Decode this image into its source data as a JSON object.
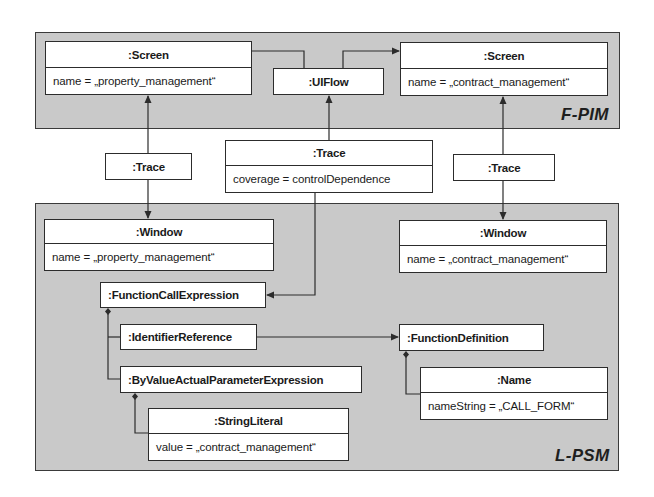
{
  "diagram": {
    "type": "UML object diagram",
    "colors": {
      "panel_fill": "#c9c9c9",
      "box_fill": "#ffffff",
      "line": "#2c2c2c"
    },
    "panels": {
      "fpim": {
        "label": "F-PIM"
      },
      "lpsm": {
        "label": "L-PSM"
      }
    },
    "objects": {
      "screen_left": {
        "name": ":Screen",
        "attribute": "name = „property_management“"
      },
      "uiflow": {
        "name": ":UIFlow"
      },
      "screen_right": {
        "name": ":Screen",
        "attribute": "name = „contract_management“"
      },
      "trace_left": {
        "name": ":Trace"
      },
      "trace_middle": {
        "name": ":Trace",
        "attribute": "coverage = controlDependence"
      },
      "trace_right": {
        "name": ":Trace"
      },
      "window_left": {
        "name": ":Window",
        "attribute": "name = „property_management“"
      },
      "window_right": {
        "name": ":Window",
        "attribute": "name = „contract_management“"
      },
      "function_call_expression": {
        "name": ":FunctionCallExpression"
      },
      "identifier_reference": {
        "name": ":IdentifierReference"
      },
      "by_value_param_expr": {
        "name": ":ByValueActualParameterExpression"
      },
      "string_literal": {
        "name": ":StringLiteral",
        "attribute": "value = „contract_management“"
      },
      "function_definition": {
        "name": ":FunctionDefinition"
      },
      "name_obj": {
        "name": ":Name",
        "attribute": "nameString = „CALL_FORM“"
      }
    },
    "links": [
      {
        "from": "screen_left",
        "to": "uiflow",
        "kind": "line"
      },
      {
        "from": "uiflow",
        "to": "screen_right",
        "kind": "arrow"
      },
      {
        "from": "trace_left",
        "to": "screen_left",
        "kind": "arrow"
      },
      {
        "from": "trace_left",
        "to": "window_left",
        "kind": "arrow"
      },
      {
        "from": "trace_middle",
        "to": "uiflow",
        "kind": "arrow"
      },
      {
        "from": "trace_middle",
        "to": "function_call_expression",
        "kind": "arrow"
      },
      {
        "from": "trace_right",
        "to": "screen_right",
        "kind": "arrow"
      },
      {
        "from": "trace_right",
        "to": "window_right",
        "kind": "arrow"
      },
      {
        "from": "function_call_expression",
        "to": "identifier_reference",
        "kind": "composition"
      },
      {
        "from": "function_call_expression",
        "to": "by_value_param_expr",
        "kind": "composition"
      },
      {
        "from": "identifier_reference",
        "to": "function_definition",
        "kind": "arrow"
      },
      {
        "from": "by_value_param_expr",
        "to": "string_literal",
        "kind": "composition"
      },
      {
        "from": "function_definition",
        "to": "name_obj",
        "kind": "composition"
      }
    ]
  }
}
